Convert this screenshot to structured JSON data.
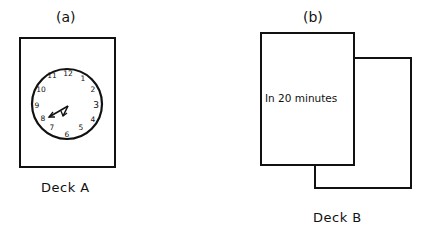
{
  "panels": {
    "a": {
      "tag": "(a)",
      "caption": "Deck A",
      "card": {
        "type": "clock-face",
        "numerals": [
          "12",
          "1",
          "2",
          "3",
          "4",
          "5",
          "6",
          "7",
          "8",
          "9",
          "10",
          "11"
        ],
        "hour_hand_points_to": "8",
        "minute_hand_points_to": "7",
        "time_shown": "7:40"
      }
    },
    "b": {
      "tag": "(b)",
      "caption": "Deck B",
      "front_card": {
        "text": "In 20 minutes"
      },
      "back_card": {
        "text_line1": "minutes",
        "text_line2": "ago"
      }
    }
  },
  "colors": {
    "ink": "#111111",
    "background": "#ffffff"
  }
}
